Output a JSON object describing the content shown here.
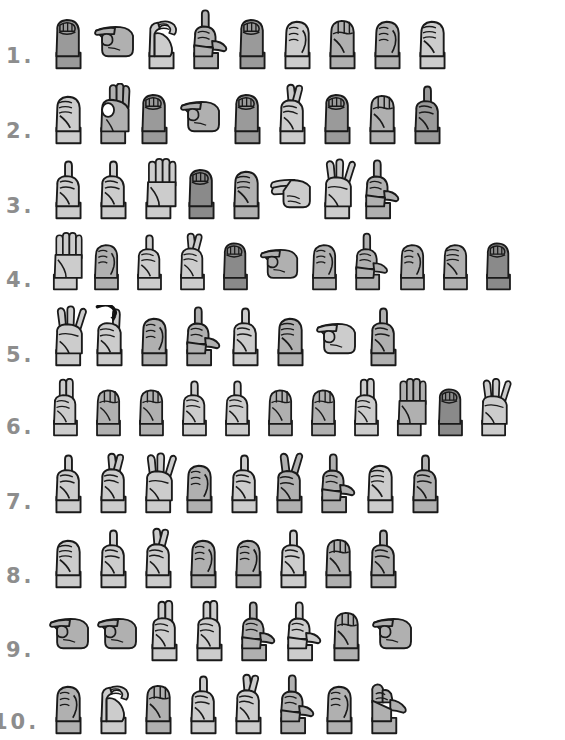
{
  "page": {
    "top_partial_text": "",
    "background_color": "#ffffff",
    "ink_color": "#1a1a1a",
    "number_color": "#8d8d8d",
    "palette": {
      "light": "#cccccc",
      "mid": "#b0b0b0",
      "dark": "#9a9a9a",
      "darker": "#8a8a8a",
      "outline": "#1a1a1a"
    }
  },
  "rows": [
    {
      "number": "1.",
      "y": 8,
      "number_y": 46,
      "number_x": 6,
      "signs_x": 46,
      "scale": 1.0,
      "letters": [
        {
          "letter": "E",
          "shade": "dark"
        },
        {
          "letter": "X",
          "shade": "mid"
        },
        {
          "letter": "C",
          "shade": "light"
        },
        {
          "letter": "L",
          "shade": "mid"
        },
        {
          "letter": "E",
          "shade": "dark"
        },
        {
          "letter": "A",
          "shade": "light"
        },
        {
          "letter": "M",
          "shade": "mid"
        },
        {
          "letter": "A",
          "shade": "mid"
        },
        {
          "letter": "S",
          "shade": "light"
        }
      ]
    },
    {
      "number": "2.",
      "y": 83,
      "number_y": 121,
      "number_x": 6,
      "signs_x": 46,
      "scale": 1.0,
      "letters": [
        {
          "letter": "S",
          "shade": "light"
        },
        {
          "letter": "F",
          "shade": "mid"
        },
        {
          "letter": "E",
          "shade": "dark"
        },
        {
          "letter": "X",
          "shade": "mid"
        },
        {
          "letter": "E",
          "shade": "dark"
        },
        {
          "letter": "R",
          "shade": "light"
        },
        {
          "letter": "E",
          "shade": "dark"
        },
        {
          "letter": "M",
          "shade": "mid"
        },
        {
          "letter": "D",
          "shade": "dark"
        }
      ]
    },
    {
      "number": "3.",
      "y": 158,
      "number_y": 196,
      "number_x": 6,
      "signs_x": 46,
      "scale": 1.0,
      "letters": [
        {
          "letter": "D",
          "shade": "light"
        },
        {
          "letter": "D",
          "shade": "light"
        },
        {
          "letter": "B",
          "shade": "light"
        },
        {
          "letter": "E",
          "shade": "darker"
        },
        {
          "letter": "S",
          "shade": "mid"
        },
        {
          "letter": "H",
          "shade": "light"
        },
        {
          "letter": "W",
          "shade": "light"
        },
        {
          "letter": "L",
          "shade": "mid"
        }
      ]
    },
    {
      "number": "4.",
      "y": 232,
      "number_y": 270,
      "number_x": 6,
      "signs_x": 44,
      "scale": 0.96,
      "letters": [
        {
          "letter": "B",
          "shade": "light"
        },
        {
          "letter": "A",
          "shade": "mid"
        },
        {
          "letter": "D",
          "shade": "light"
        },
        {
          "letter": "R",
          "shade": "light"
        },
        {
          "letter": "E",
          "shade": "darker"
        },
        {
          "letter": "X",
          "shade": "mid"
        },
        {
          "letter": "A",
          "shade": "mid"
        },
        {
          "letter": "L",
          "shade": "mid"
        },
        {
          "letter": "A",
          "shade": "mid"
        },
        {
          "letter": "S",
          "shade": "mid"
        },
        {
          "letter": "E",
          "shade": "darker"
        }
      ]
    },
    {
      "number": "5.",
      "y": 305,
      "number_y": 345,
      "number_x": 6,
      "signs_x": 46,
      "scale": 1.0,
      "letters": [
        {
          "letter": "W",
          "shade": "light"
        },
        {
          "letter": "J",
          "shade": "light"
        },
        {
          "letter": "A",
          "shade": "mid"
        },
        {
          "letter": "L",
          "shade": "mid"
        },
        {
          "letter": "D",
          "shade": "light"
        },
        {
          "letter": "S",
          "shade": "mid"
        },
        {
          "letter": "X",
          "shade": "light"
        },
        {
          "letter": "D",
          "shade": "mid"
        }
      ]
    },
    {
      "number": "6.",
      "y": 378,
      "number_y": 417,
      "number_x": 6,
      "signs_x": 44,
      "scale": 0.96,
      "letters": [
        {
          "letter": "U",
          "shade": "light"
        },
        {
          "letter": "M",
          "shade": "mid"
        },
        {
          "letter": "M",
          "shade": "mid"
        },
        {
          "letter": "D",
          "shade": "light"
        },
        {
          "letter": "D",
          "shade": "light"
        },
        {
          "letter": "M",
          "shade": "mid"
        },
        {
          "letter": "M",
          "shade": "mid"
        },
        {
          "letter": "U",
          "shade": "light"
        },
        {
          "letter": "B",
          "shade": "mid"
        },
        {
          "letter": "E",
          "shade": "darker"
        },
        {
          "letter": "W",
          "shade": "light"
        }
      ]
    },
    {
      "number": "7.",
      "y": 452,
      "number_y": 492,
      "number_x": 6,
      "signs_x": 46,
      "scale": 1.0,
      "letters": [
        {
          "letter": "D",
          "shade": "light"
        },
        {
          "letter": "R",
          "shade": "light"
        },
        {
          "letter": "W",
          "shade": "light"
        },
        {
          "letter": "A",
          "shade": "mid"
        },
        {
          "letter": "D",
          "shade": "light"
        },
        {
          "letter": "V",
          "shade": "mid"
        },
        {
          "letter": "L",
          "shade": "mid"
        },
        {
          "letter": "S",
          "shade": "light"
        },
        {
          "letter": "D",
          "shade": "mid"
        }
      ]
    },
    {
      "number": "8.",
      "y": 527,
      "number_y": 566,
      "number_x": 6,
      "signs_x": 46,
      "scale": 1.0,
      "letters": [
        {
          "letter": "S",
          "shade": "light"
        },
        {
          "letter": "D",
          "shade": "light"
        },
        {
          "letter": "R",
          "shade": "light"
        },
        {
          "letter": "A",
          "shade": "mid"
        },
        {
          "letter": "A",
          "shade": "mid"
        },
        {
          "letter": "D",
          "shade": "light"
        },
        {
          "letter": "M",
          "shade": "mid"
        },
        {
          "letter": "D",
          "shade": "mid"
        }
      ]
    },
    {
      "number": "9.",
      "y": 600,
      "number_y": 640,
      "number_x": 6,
      "signs_x": 46,
      "scale": 1.0,
      "letters": [
        {
          "letter": "X",
          "shade": "mid"
        },
        {
          "letter": "X",
          "shade": "mid"
        },
        {
          "letter": "U",
          "shade": "light"
        },
        {
          "letter": "U",
          "shade": "light"
        },
        {
          "letter": "L",
          "shade": "mid"
        },
        {
          "letter": "L",
          "shade": "light"
        },
        {
          "letter": "M",
          "shade": "mid"
        },
        {
          "letter": "X",
          "shade": "mid"
        }
      ]
    },
    {
      "number": "10.",
      "y": 673,
      "number_y": 712,
      "number_x": -7,
      "signs_x": 46,
      "scale": 1.0,
      "letters": [
        {
          "letter": "A",
          "shade": "mid"
        },
        {
          "letter": "C",
          "shade": "light"
        },
        {
          "letter": "M",
          "shade": "mid"
        },
        {
          "letter": "D",
          "shade": "light"
        },
        {
          "letter": "R",
          "shade": "light"
        },
        {
          "letter": "L",
          "shade": "mid"
        },
        {
          "letter": "A",
          "shade": "mid"
        },
        {
          "letter": "Y",
          "shade": "mid"
        }
      ]
    }
  ]
}
